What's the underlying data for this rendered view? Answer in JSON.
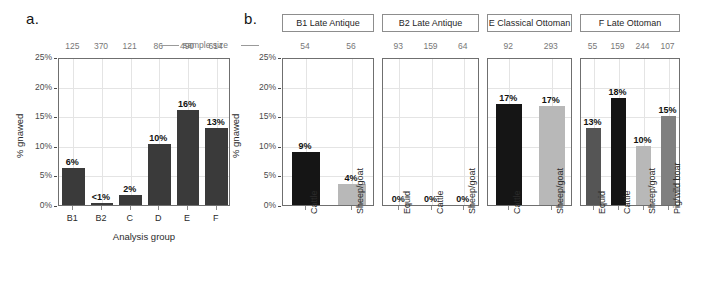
{
  "figure": {
    "panel_a_letter": "a.",
    "panel_b_letter": "b.",
    "sample_size_label": "sample size",
    "y_axis_title": "% gnawed",
    "x_axis_title_a": "Analysis group",
    "y_ticks": [
      "0%",
      "5%",
      "10%",
      "15%",
      "20%",
      "25%"
    ],
    "colors": {
      "bar_panel_a": "#3a3a3a",
      "black": "#151515",
      "dark_gray": "#555555",
      "medium_gray": "#808080",
      "light_gray": "#b8b8b8",
      "grid": "#e4e4e4",
      "panel_border": "#6f6f6f",
      "sample_size_text": "#777777"
    }
  },
  "chart_data": [
    {
      "type": "bar",
      "title": "a.",
      "xlabel": "Analysis group",
      "ylabel": "% gnawed",
      "ylim": [
        0,
        25
      ],
      "ytick_values": [
        0,
        5,
        10,
        15,
        20,
        25
      ],
      "ytick_labels": [
        "0%",
        "5%",
        "10%",
        "15%",
        "20%",
        "25%"
      ],
      "grid": true,
      "legend": "none",
      "categories": [
        "B1",
        "B2",
        "C",
        "D",
        "E",
        "F"
      ],
      "values": [
        6.3,
        0.3,
        1.7,
        10.3,
        16.0,
        13.0
      ],
      "data_labels": [
        "6%",
        "<1%",
        "2%",
        "10%",
        "16%",
        "13%"
      ],
      "sample_sizes": [
        125,
        370,
        121,
        86,
        490,
        614
      ],
      "bar_colors": [
        "#3a3a3a",
        "#3a3a3a",
        "#3a3a3a",
        "#3a3a3a",
        "#3a3a3a",
        "#3a3a3a"
      ]
    },
    {
      "type": "bar",
      "title": "b.",
      "xlabel": "",
      "ylabel": "% gnawed",
      "ylim": [
        0,
        25
      ],
      "ytick_values": [
        0,
        5,
        10,
        15,
        20,
        25
      ],
      "ytick_labels": [
        "0%",
        "5%",
        "10%",
        "15%",
        "20%",
        "25%"
      ],
      "grid": true,
      "legend": "none",
      "facets": [
        {
          "name": "B1 Late Antique",
          "categories": [
            "Cattle",
            "Sheep/goat"
          ],
          "values": [
            9.0,
            3.6
          ],
          "data_labels": [
            "9%",
            "4%"
          ],
          "sample_sizes": [
            54,
            56
          ],
          "bar_colors": [
            "#151515",
            "#b8b8b8"
          ]
        },
        {
          "name": "B2 Late Antique",
          "categories": [
            "Equid",
            "Cattle",
            "Sheep/goat"
          ],
          "values": [
            0,
            0,
            0
          ],
          "data_labels": [
            "0%",
            "0%",
            "0%"
          ],
          "sample_sizes": [
            93,
            159,
            64
          ],
          "bar_colors": [
            "#555555",
            "#151515",
            "#b8b8b8"
          ]
        },
        {
          "name": "E Classical Ottoman",
          "categories": [
            "Cattle",
            "Sheep/goat"
          ],
          "values": [
            17.0,
            16.8
          ],
          "data_labels": [
            "17%",
            "17%"
          ],
          "sample_sizes": [
            92,
            293
          ],
          "bar_colors": [
            "#151515",
            "#b8b8b8"
          ]
        },
        {
          "name": "F Late Ottoman",
          "categories": [
            "Equid",
            "Cattle",
            "Sheep/goat",
            "Pig/wild boar"
          ],
          "values": [
            13.0,
            18.0,
            10.0,
            15.0
          ],
          "data_labels": [
            "13%",
            "18%",
            "10%",
            "15%"
          ],
          "sample_sizes": [
            55,
            159,
            244,
            107
          ],
          "bar_colors": [
            "#555555",
            "#151515",
            "#b8b8b8",
            "#808080"
          ]
        }
      ]
    }
  ]
}
